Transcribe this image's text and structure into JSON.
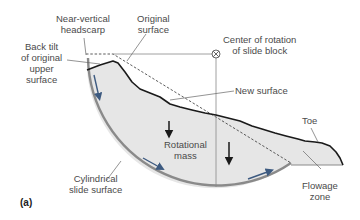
{
  "diagram": {
    "type": "rotational-slide-cross-section",
    "panel_label": "(a)",
    "labels": {
      "near_vertical_headscarp": [
        "Near-vertical",
        "headscarp"
      ],
      "original_surface": [
        "Original",
        "surface"
      ],
      "center_of_rotation": [
        "Center of rotation",
        "of slide block"
      ],
      "back_tilt": [
        "Back tilt",
        "of original",
        "upper",
        "surface"
      ],
      "new_surface": "New surface",
      "toe": "Toe",
      "rotational_mass": [
        "Rotational",
        "mass"
      ],
      "cylindrical_slide_surface": [
        "Cylindrical",
        "slide surface"
      ],
      "flowage_zone": [
        "Flowage",
        "zone"
      ]
    },
    "colors": {
      "mass_fill": "#e6e6e6",
      "slide_surface": "#8a8a8a",
      "ground_line": "#1a1a1a",
      "leader_line": "#666666",
      "label_text": "#4a4a4a",
      "arrow_dark": "#1a1a1a",
      "arrow_blue": "#3d5a80"
    }
  }
}
